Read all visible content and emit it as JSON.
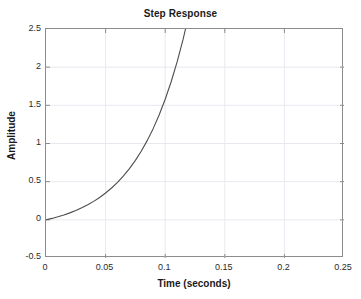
{
  "figure": {
    "width": 361,
    "height": 299,
    "background_color": "#ffffff",
    "axes_color": "#8c8c8c",
    "grid_color": "#e8e8ef",
    "line_color": "#4d4d4d",
    "text_color": "#1a1a1a"
  },
  "chart_data": {
    "type": "line",
    "title": "Step Response",
    "xlabel": "Time (seconds)",
    "ylabel": "Amplitude",
    "xlim": [
      0,
      0.25
    ],
    "ylim": [
      -0.5,
      2.5
    ],
    "xticks": [
      0,
      0.05,
      0.1,
      0.15,
      0.2,
      0.25
    ],
    "xtick_labels": [
      "0",
      "0.05",
      "0.1",
      "0.15",
      "0.2",
      "0.25"
    ],
    "yticks": [
      -0.5,
      0,
      0.5,
      1,
      1.5,
      2,
      2.5
    ],
    "ytick_labels": [
      "-0.5",
      "0",
      "0.5",
      "1",
      "1.5",
      "2",
      "2.5"
    ],
    "grid": true,
    "legend": null,
    "series": [
      {
        "name": "step response",
        "color": "#4d4d4d",
        "linewidth": 1,
        "description": "Unstable exponentially growing step response; starts at 0 and rises off the top of the axes near t = 0.162 s",
        "x": [
          0,
          0.005,
          0.01,
          0.015,
          0.02,
          0.025,
          0.03,
          0.035,
          0.04,
          0.045,
          0.05,
          0.055,
          0.06,
          0.065,
          0.07,
          0.075,
          0.08,
          0.085,
          0.09,
          0.095,
          0.1,
          0.105,
          0.11,
          0.115,
          0.12,
          0.125,
          0.13,
          0.135,
          0.14,
          0.145,
          0.15,
          0.155,
          0.16,
          0.162
        ],
        "y": [
          0,
          0.0187,
          0.0399,
          0.0639,
          0.0912,
          0.122,
          0.157,
          0.197,
          0.242,
          0.293,
          0.351,
          0.417,
          0.491,
          0.575,
          0.671,
          0.779,
          0.902,
          1.041,
          1.198,
          1.377,
          1.579,
          1.809,
          2.069,
          2.364,
          2.698,
          3.077,
          3.506,
          3.992,
          4.543,
          5.167,
          5.874,
          6.676,
          7.584,
          7.978
        ]
      }
    ]
  }
}
